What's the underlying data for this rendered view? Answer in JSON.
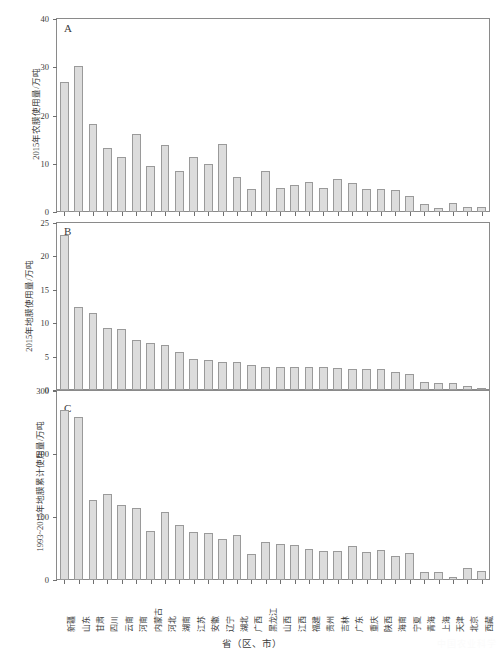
{
  "figure": {
    "xaxis_title": "省（区、市）",
    "watermark": "中国农业科学"
  },
  "chart_data": [
    {
      "type": "bar",
      "panel_letter": "A",
      "title": "",
      "ylabel": "2015年农膜使用量/万吨",
      "xlabel": "省（区、市）",
      "ylim": [
        0,
        40
      ],
      "yticks": [
        0,
        10,
        20,
        30,
        40
      ],
      "grid": false,
      "legend": "none",
      "bar_color": "#dcdcdc",
      "bar_edge_color": "#9a9a9a",
      "categories": [
        "新疆",
        "山东",
        "甘肃",
        "四川",
        "云南",
        "河南",
        "内蒙古",
        "河北",
        "湖南",
        "江苏",
        "安徽",
        "辽宁",
        "湖北",
        "广西",
        "黑龙江",
        "山西",
        "江西",
        "福建",
        "贵州",
        "吉林",
        "广东",
        "重庆",
        "陕西",
        "海南",
        "宁夏",
        "青海",
        "上海",
        "天津",
        "北京",
        "西藏"
      ],
      "values": [
        26.9,
        30.2,
        18.3,
        13.2,
        11.3,
        16.1,
        9.5,
        13.8,
        8.4,
        11.3,
        9.9,
        14.2,
        7.2,
        4.7,
        8.4,
        4.9,
        5.5,
        6.3,
        5.0,
        6.8,
        6.0,
        4.8,
        4.7,
        4.5,
        3.4,
        1.7,
        0.9,
        1.9,
        1.1,
        1.1
      ]
    },
    {
      "type": "bar",
      "panel_letter": "B",
      "title": "",
      "ylabel": "2015年地膜使用量/万吨",
      "xlabel": "省（区、市）",
      "ylim": [
        0,
        25
      ],
      "yticks": [
        0,
        5,
        10,
        15,
        20,
        25
      ],
      "grid": false,
      "legend": "none",
      "bar_color": "#dcdcdc",
      "bar_edge_color": "#9a9a9a",
      "categories": [
        "新疆",
        "山东",
        "甘肃",
        "四川",
        "云南",
        "河南",
        "内蒙古",
        "河北",
        "湖南",
        "江苏",
        "安徽",
        "辽宁",
        "湖北",
        "广西",
        "黑龙江",
        "山西",
        "江西",
        "福建",
        "贵州",
        "吉林",
        "广东",
        "重庆",
        "陕西",
        "海南",
        "宁夏",
        "青海",
        "上海",
        "天津",
        "北京",
        "西藏"
      ],
      "values": [
        23.2,
        12.4,
        11.5,
        9.3,
        9.2,
        7.5,
        7.0,
        6.7,
        5.7,
        4.7,
        4.5,
        4.2,
        4.2,
        3.7,
        3.5,
        3.4,
        3.4,
        3.4,
        3.4,
        3.3,
        3.2,
        3.1,
        3.1,
        2.7,
        2.4,
        1.2,
        1.1,
        1.0,
        0.6,
        0.2
      ]
    },
    {
      "type": "bar",
      "panel_letter": "C",
      "title": "",
      "ylabel": "1993~2015年地膜累计使用量/万吨",
      "xlabel": "省（区、市）",
      "ylim": [
        0,
        300
      ],
      "yticks": [
        0,
        100,
        200,
        300
      ],
      "grid": false,
      "legend": "none",
      "bar_color": "#dcdcdc",
      "bar_edge_color": "#9a9a9a",
      "categories": [
        "新疆",
        "山东",
        "甘肃",
        "四川",
        "云南",
        "河南",
        "内蒙古",
        "河北",
        "湖南",
        "江苏",
        "安徽",
        "辽宁",
        "湖北",
        "广西",
        "黑龙江",
        "山西",
        "江西",
        "福建",
        "贵州",
        "吉林",
        "广东",
        "重庆",
        "陕西",
        "海南",
        "宁夏",
        "青海",
        "上海",
        "天津",
        "北京",
        "西藏"
      ],
      "values": [
        270,
        259,
        127,
        137,
        119,
        114,
        78,
        108,
        87,
        77,
        75,
        65,
        71,
        42,
        61,
        57,
        55,
        50,
        46,
        46,
        54,
        45,
        48,
        38,
        43,
        12,
        13,
        4,
        19,
        14
      ]
    }
  ]
}
